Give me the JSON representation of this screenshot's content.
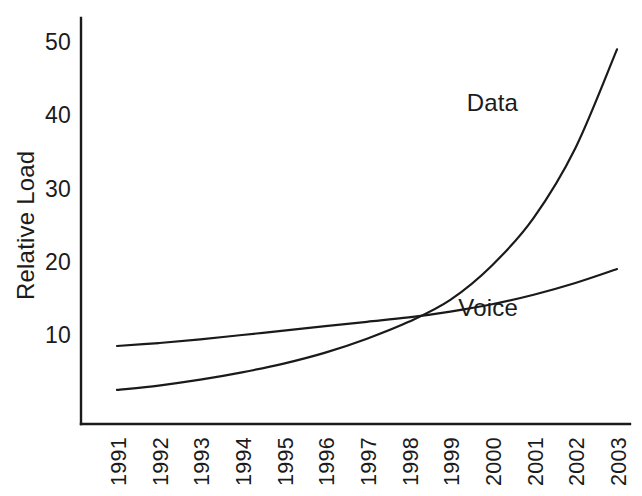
{
  "chart_data": {
    "type": "line",
    "title": "",
    "subtitle": "",
    "xlabel": "",
    "ylabel": "Relative Load",
    "grid": false,
    "legend_position": "inline-annotation",
    "x": [
      1991,
      1992,
      1993,
      1994,
      1995,
      1996,
      1997,
      1998,
      1999,
      2000,
      2001,
      2002,
      2003
    ],
    "categories": [
      "1991",
      "1992",
      "1993",
      "1994",
      "1995",
      "1996",
      "1997",
      "1998",
      "1999",
      "2000",
      "2001",
      "2002",
      "2003"
    ],
    "xtick_labels": [
      "1991",
      "1992",
      "1993",
      "1994",
      "1995",
      "1996",
      "1997",
      "1998",
      "1999",
      "2000",
      "2001",
      "2002",
      "2003"
    ],
    "ytick_labels": [
      "10",
      "20",
      "30",
      "40",
      "50"
    ],
    "ytick_values": [
      10,
      20,
      30,
      40,
      50
    ],
    "ylim": [
      0,
      56
    ],
    "xlim": [
      1990.5,
      2003.6
    ],
    "series": [
      {
        "name": "Voice",
        "annotation": "Voice",
        "color": "#1a1a1a",
        "values": [
          8.5,
          8.9,
          9.4,
          10.0,
          10.6,
          11.2,
          11.8,
          12.4,
          13.2,
          14.2,
          15.5,
          17.1,
          19.0
        ]
      },
      {
        "name": "Data",
        "annotation": "Data",
        "color": "#1a1a1a",
        "values": [
          2.5,
          3.1,
          3.9,
          4.9,
          6.1,
          7.6,
          9.5,
          11.8,
          14.8,
          19.5,
          26.0,
          35.5,
          49.0
        ]
      }
    ],
    "annotations": [
      {
        "text": "Data",
        "series": "Data",
        "x": 2000.4,
        "y": 41.5
      },
      {
        "text": "Voice",
        "series": "Voice",
        "x": 2000.2,
        "y": 13.6
      }
    ],
    "crossing_point": {
      "x": 1998.5,
      "y": 12.5
    }
  },
  "colors": {
    "background": "#ffffff",
    "axis": "#1a1a1a",
    "text": "#1b1b1b",
    "voice_line": "#1a1a1a",
    "data_line": "#1a1a1a"
  }
}
